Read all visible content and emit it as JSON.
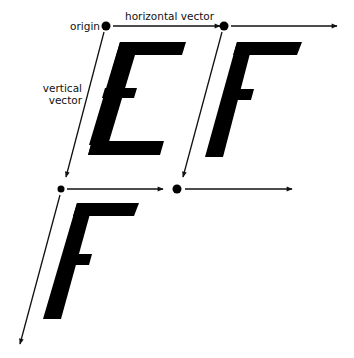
{
  "labels": {
    "origin": "origin",
    "horizontal_vector": "horizontal vector",
    "vertical_vector_line1": "vertical",
    "vertical_vector_line2": "vector"
  },
  "glyphs": [
    "E",
    "F",
    "F"
  ],
  "colors": {
    "ink": "#000000",
    "line": "#111111",
    "background": "#ffffff"
  }
}
